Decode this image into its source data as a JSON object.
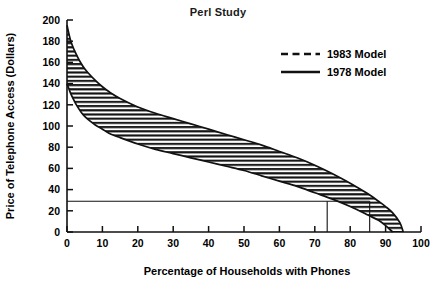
{
  "chart_data": {
    "type": "area",
    "title": "Perl Study",
    "xlabel": "Percentage of Households with Phones",
    "ylabel": "Price of Telephone Access  (Dollars)",
    "xlim": [
      0,
      100
    ],
    "ylim": [
      0,
      200
    ],
    "grid": false,
    "legend_position": "top-right",
    "xticks": [
      "0",
      "10",
      "20",
      "30",
      "40",
      "50",
      "60",
      "70",
      "80",
      "90",
      "100"
    ],
    "xtick_values": [
      0,
      10,
      20,
      30,
      40,
      50,
      60,
      70,
      80,
      90,
      100
    ],
    "yticks": [
      "0",
      "20",
      "40",
      "60",
      "80",
      "100",
      "120",
      "140",
      "160",
      "180",
      "200"
    ],
    "ytick_values": [
      0,
      20,
      40,
      60,
      80,
      100,
      120,
      140,
      160,
      180,
      200
    ],
    "fill_style": "horizontal-hatch",
    "series": [
      {
        "name": "1983 Model",
        "line_style": "dashed",
        "x": [
          0,
          1,
          2,
          3,
          4,
          5,
          6,
          8,
          10,
          12,
          15,
          20,
          25,
          30,
          35,
          40,
          45,
          50,
          55,
          60,
          65,
          70,
          75,
          80,
          85,
          88,
          90,
          92,
          94,
          95
        ],
        "values": [
          195,
          181,
          172,
          165,
          159,
          154,
          150,
          143,
          137,
          132,
          126,
          118,
          112,
          107,
          102,
          97,
          92,
          87,
          82,
          76,
          70,
          63,
          55,
          46,
          36,
          29,
          24,
          18,
          9,
          0
        ]
      },
      {
        "name": "1978 Model",
        "line_style": "solid",
        "x": [
          0,
          1,
          2,
          3,
          4,
          5,
          6,
          8,
          10,
          12,
          15,
          20,
          25,
          30,
          35,
          40,
          45,
          50,
          55,
          60,
          65,
          70,
          75,
          80,
          85,
          88,
          90,
          91,
          92
        ],
        "values": [
          140,
          131,
          124,
          118,
          113,
          109,
          106,
          101,
          97,
          93,
          89,
          83,
          78,
          74,
          70,
          66,
          62,
          58,
          53,
          48,
          43,
          37,
          31,
          24,
          16,
          11,
          6,
          3,
          0
        ]
      }
    ],
    "reference_lines": [
      {
        "name": "price-reference",
        "orientation": "horizontal",
        "value": 29,
        "x_from": 0,
        "x_to": 85.5
      },
      {
        "name": "households-1978-reference",
        "orientation": "vertical",
        "value": 73.5,
        "y_from": 0,
        "y_to": 29
      },
      {
        "name": "households-1983-reference",
        "orientation": "vertical",
        "value": 85.5,
        "y_from": 0,
        "y_to": 29
      }
    ]
  },
  "legend": {
    "entries": [
      {
        "label": "1983 Model",
        "style": "dashed"
      },
      {
        "label": "1978 Model",
        "style": "solid"
      }
    ]
  }
}
